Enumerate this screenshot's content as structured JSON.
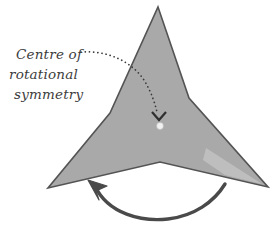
{
  "diagram": {
    "label": {
      "line1": "Centre of",
      "line2": "rotational",
      "line3": "symmetry",
      "full_text": "Centre of rotational symmetry"
    },
    "colors": {
      "shape_fill": "#a9a9a9",
      "shape_fill_highlight": "#bcbcbc",
      "shape_stroke": "#545454",
      "background": "#ffffff",
      "text": "#3c3c3c",
      "leader_line": "#3a3a3a",
      "rotation_arrow": "#4a4a4a",
      "centre_dot": "#f2f2f2"
    },
    "shape": {
      "name": "three-pointed-star",
      "points_count": 3,
      "rotational_symmetry_order": 3,
      "outer_vertices": [
        {
          "x": 158,
          "y": 7
        },
        {
          "x": 268,
          "y": 187
        },
        {
          "x": 48,
          "y": 188
        }
      ],
      "inner_vertices": [
        {
          "x": 189,
          "y": 98
        },
        {
          "x": 160,
          "y": 162
        },
        {
          "x": 110,
          "y": 113
        }
      ]
    },
    "centre_point": {
      "x": 160,
      "y": 126
    },
    "rotation_arrow": {
      "direction": "counterclockwise",
      "arrowhead_at": "left"
    },
    "leader_line": {
      "style": "dotted",
      "arrowhead": "chevron-down"
    }
  }
}
